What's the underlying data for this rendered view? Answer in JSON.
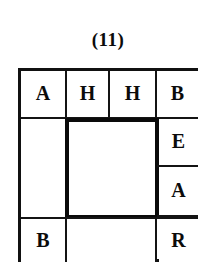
{
  "figure": {
    "caption": "(11)",
    "kind": "letter-grid-puzzle",
    "ink_color": "#111111",
    "paper_color": "#ffffff"
  },
  "grid": {
    "top_row": {
      "cells": [
        {
          "label": "A",
          "empty": false
        },
        {
          "label": "H",
          "empty": false
        },
        {
          "label": "H",
          "empty": false
        },
        {
          "label": "B",
          "empty": false
        }
      ]
    },
    "right_column": {
      "cells": [
        {
          "label": "B",
          "empty": false
        },
        {
          "label": "E",
          "empty": false
        },
        {
          "label": "A",
          "empty": false
        },
        {
          "label": "R",
          "empty": false
        }
      ]
    },
    "left_column": {
      "cells": [
        {
          "label": "A",
          "empty": false
        },
        {
          "label": "",
          "empty": true
        },
        {
          "label": "B",
          "empty": false
        }
      ]
    },
    "bottom_row": {
      "cells": [
        {
          "label": "B",
          "empty": false
        },
        {
          "label": "",
          "empty": true
        },
        {
          "label": "R",
          "empty": false
        }
      ]
    },
    "center": {
      "label": "",
      "empty": true
    }
  }
}
